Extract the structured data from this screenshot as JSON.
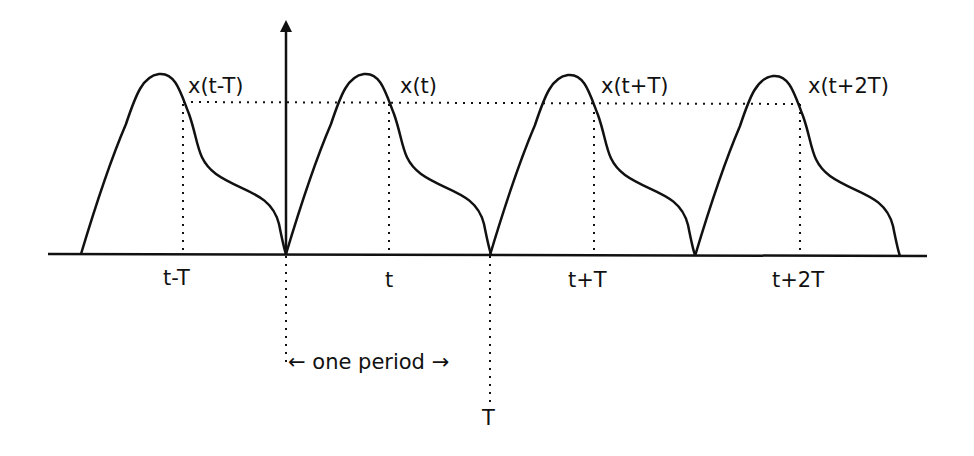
{
  "diagram": {
    "curve_labels": [
      "x(t-T)",
      "x(t)",
      "x(t+T)",
      "x(t+2T)"
    ],
    "axis_labels": [
      "t-T",
      "t",
      "t+T",
      "t+2T"
    ],
    "period_label": "one period",
    "period_arrow_left": "←",
    "period_arrow_right": "→",
    "period_end_label": "T",
    "colors": {
      "line": "#111111",
      "background": "#ffffff"
    }
  }
}
